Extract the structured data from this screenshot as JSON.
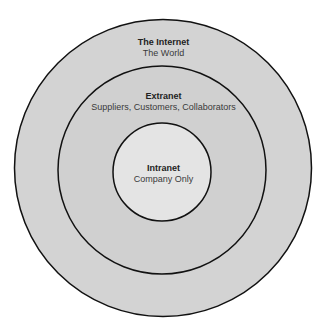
{
  "diagram": {
    "type": "concentric-circles",
    "rings": [
      {
        "title": "The Internet",
        "subtitle": "The World",
        "fill": "#d2d2d2"
      },
      {
        "title": "Extranet",
        "subtitle": "Suppliers, Customers, Collaborators",
        "fill": "#d0d0d0"
      },
      {
        "title": "Intranet",
        "subtitle": "Company Only",
        "fill": "#e3e3e3"
      }
    ],
    "stroke": "#111111"
  }
}
